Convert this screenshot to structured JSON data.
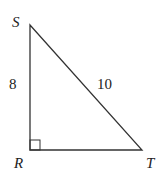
{
  "diagram": {
    "type": "right-triangle",
    "vertices": {
      "S": {
        "label": "S",
        "x": 30,
        "y": 25
      },
      "R": {
        "label": "R",
        "x": 30,
        "y": 150
      },
      "T": {
        "label": "T",
        "x": 142,
        "y": 150
      }
    },
    "right_angle_at": "R",
    "sides": {
      "SR": {
        "label": "8"
      },
      "ST": {
        "label": "10"
      }
    },
    "stroke_color": "#333333"
  }
}
